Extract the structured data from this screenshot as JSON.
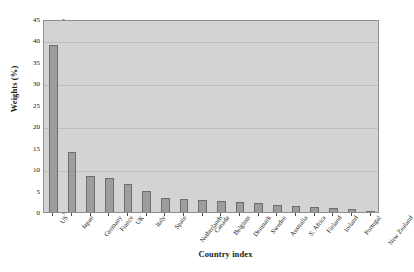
{
  "chart_data": {
    "type": "bar",
    "title": "",
    "xlabel": "Country index",
    "ylabel": "Weights (%)",
    "ylim": [
      0,
      45
    ],
    "ytick_step": 5,
    "yticks": [
      0,
      5,
      10,
      15,
      20,
      25,
      30,
      35,
      40,
      45
    ],
    "grid": true,
    "gridlines_at": [
      10,
      20,
      30,
      40
    ],
    "legend": null,
    "categories": [
      "US",
      "Japan",
      "Germany",
      "France",
      "UK",
      "Italy",
      "Spain",
      "Netherlands",
      "Canada",
      "Belgium",
      "Denmark",
      "Sweden",
      "Australia",
      "S. Africa",
      "Finland",
      "Ireland",
      "Portugal",
      "New Zealand"
    ],
    "values": [
      39.0,
      14.0,
      8.5,
      8.0,
      6.5,
      5.0,
      3.2,
      3.0,
      2.8,
      2.5,
      2.3,
      2.0,
      1.7,
      1.5,
      1.2,
      1.0,
      0.6,
      0.3
    ],
    "colors": {
      "bar_fill": "#9d9d9d",
      "bar_edge": "#6e6e6e",
      "plot_background": "#d3d3d3",
      "gridline": "#bdbdbd",
      "axis_line": "#8f8f8f",
      "text": "#111111",
      "page_background": "#ffffff"
    }
  },
  "ghost_text": {
    "line1": "",
    "line2": ""
  }
}
